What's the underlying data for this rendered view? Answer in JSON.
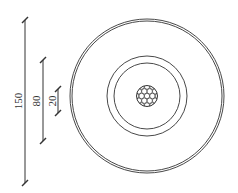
{
  "diagram": {
    "type": "cable cross-section",
    "stroke_color": "#333333",
    "background": "#ffffff",
    "dimensions": [
      {
        "label": "150",
        "x": 25,
        "y1": 20,
        "y2": 183,
        "label_y": 101
      },
      {
        "label": "80",
        "x": 43,
        "y1": 60,
        "y2": 141,
        "label_y": 101
      },
      {
        "label": "20",
        "x": 58,
        "y1": 89,
        "y2": 113,
        "label_y": 101
      }
    ],
    "circles": {
      "center": [
        147,
        96
      ],
      "outer_jacket_radii": [
        77,
        75
      ],
      "insulation_radii": [
        40,
        33
      ],
      "conductor_radius": 10.5,
      "conductor_pattern": "stranded-honeycomb"
    }
  }
}
